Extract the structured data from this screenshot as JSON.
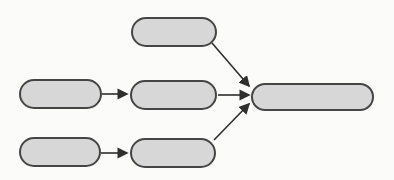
{
  "diagram": {
    "type": "flowchart",
    "title": "",
    "canvas": {
      "width": 394,
      "height": 180,
      "background": "#fbfbfa"
    },
    "style": {
      "node_fill": "#d7d7d7",
      "node_stroke": "#454545",
      "node_stroke_width": 2,
      "edge_color": "#2f2f2f",
      "edge_width": 1.6
    },
    "nodes": [
      {
        "id": "top-center",
        "label": "",
        "shape": "stadium",
        "x": 132,
        "y": 18,
        "w": 84,
        "h": 28
      },
      {
        "id": "mid-left",
        "label": "",
        "shape": "stadium",
        "x": 20,
        "y": 80,
        "w": 81,
        "h": 28
      },
      {
        "id": "mid-center",
        "label": "",
        "shape": "stadium",
        "x": 131,
        "y": 81,
        "w": 85,
        "h": 28
      },
      {
        "id": "bottom-left",
        "label": "",
        "shape": "stadium",
        "x": 20,
        "y": 138,
        "w": 80,
        "h": 28
      },
      {
        "id": "bottom-center",
        "label": "",
        "shape": "stadium",
        "x": 131,
        "y": 139,
        "w": 84,
        "h": 28
      },
      {
        "id": "right",
        "label": "",
        "shape": "stadium",
        "x": 252,
        "y": 84,
        "w": 121,
        "h": 26
      }
    ],
    "edges": [
      {
        "from": "mid-left",
        "to": "mid-center",
        "x1": 102,
        "y1": 94,
        "x2": 127,
        "y2": 94
      },
      {
        "from": "mid-center",
        "to": "right",
        "x1": 218,
        "y1": 95,
        "x2": 249,
        "y2": 95
      },
      {
        "from": "bottom-left",
        "to": "bottom-center",
        "x1": 101,
        "y1": 153,
        "x2": 127,
        "y2": 153
      },
      {
        "from": "top-center",
        "to": "right",
        "x1": 212,
        "y1": 43,
        "x2": 249,
        "y2": 86
      },
      {
        "from": "bottom-center",
        "to": "right",
        "x1": 214,
        "y1": 140,
        "x2": 249,
        "y2": 104
      }
    ]
  }
}
